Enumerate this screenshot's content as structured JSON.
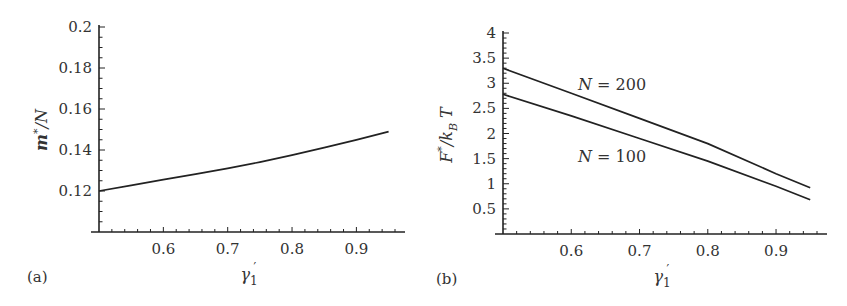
{
  "chart_data": [
    {
      "panel": "(a)",
      "type": "line",
      "title": "",
      "xlabel": "γ1′",
      "ylabel": "m*/N",
      "xlim": [
        0.5,
        0.96
      ],
      "ylim": [
        0.1,
        0.2
      ],
      "xticks": [
        "0.6",
        "0.7",
        "0.8",
        "0.9"
      ],
      "yticks": [
        "0.12",
        "0.14",
        "0.16",
        "0.18",
        "0.2"
      ],
      "grid": false,
      "legend": null,
      "series": [
        {
          "name": "m*/N",
          "x": [
            0.5,
            0.55,
            0.6,
            0.65,
            0.7,
            0.75,
            0.8,
            0.85,
            0.9,
            0.95
          ],
          "y": [
            0.12,
            0.1228,
            0.1255,
            0.1282,
            0.131,
            0.1341,
            0.1375,
            0.1411,
            0.145,
            0.149
          ]
        }
      ]
    },
    {
      "panel": "(b)",
      "type": "line",
      "title": "",
      "xlabel": "γ1′",
      "ylabel": "F*/kBT",
      "xlim": [
        0.5,
        0.96
      ],
      "ylim": [
        0,
        4
      ],
      "xticks": [
        "0.6",
        "0.7",
        "0.8",
        "0.9"
      ],
      "yticks": [
        "0.5",
        "1",
        "1.5",
        "2",
        "2.5",
        "3",
        "3.5",
        "4"
      ],
      "grid": false,
      "legend": null,
      "annotations": [
        "N = 200",
        "N = 100"
      ],
      "series": [
        {
          "name": "N = 200",
          "x": [
            0.5,
            0.6,
            0.7,
            0.8,
            0.9,
            0.95
          ],
          "y": [
            3.3,
            2.8,
            2.3,
            1.8,
            1.2,
            0.92
          ]
        },
        {
          "name": "N = 100",
          "x": [
            0.5,
            0.6,
            0.7,
            0.8,
            0.9,
            0.95
          ],
          "y": [
            2.78,
            2.35,
            1.9,
            1.45,
            0.95,
            0.68
          ]
        }
      ]
    }
  ],
  "labels": {
    "panel_a": "(a)",
    "panel_b": "(b)",
    "a_ylabel_main": "m",
    "a_ylabel_sup": "*",
    "a_ylabel_rest": "/N",
    "b_ylabel_main": "F",
    "b_ylabel_sup": "*",
    "b_ylabel_mid": "/k",
    "b_ylabel_sub": "B",
    "b_ylabel_rest": " T",
    "x_gamma": "γ",
    "x_sub": "1",
    "x_prime": "′",
    "annot_n200": "N = 200",
    "annot_n100": "N = 100"
  }
}
